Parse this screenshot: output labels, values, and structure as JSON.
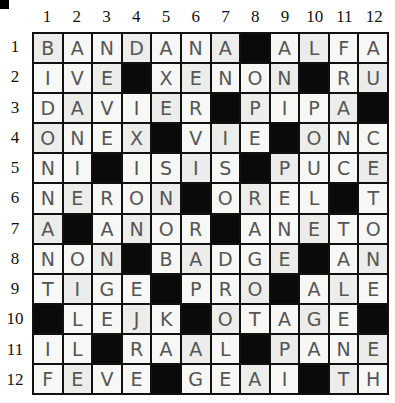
{
  "puzzle": {
    "type": "crossword",
    "rows": 12,
    "cols": 12,
    "column_numbers": [
      "1",
      "2",
      "3",
      "4",
      "5",
      "6",
      "7",
      "8",
      "9",
      "10",
      "11",
      "12"
    ],
    "row_numbers": [
      "1",
      "2",
      "3",
      "4",
      "5",
      "6",
      "7",
      "8",
      "9",
      "10",
      "11",
      "12"
    ],
    "grid": [
      [
        "B",
        "A",
        "N",
        "D",
        "A",
        "N",
        "A",
        "#",
        "A",
        "L",
        "F",
        "A"
      ],
      [
        "I",
        "V",
        "E",
        "#",
        "X",
        "E",
        "N",
        "O",
        "N",
        "#",
        "R",
        "U"
      ],
      [
        "D",
        "A",
        "V",
        "I",
        "E",
        "R",
        "#",
        "P",
        "I",
        "P",
        "A",
        "#"
      ],
      [
        "O",
        "N",
        "E",
        "X",
        "#",
        "V",
        "I",
        "E",
        "#",
        "O",
        "N",
        "C"
      ],
      [
        "N",
        "I",
        "#",
        "I",
        "S",
        "I",
        "S",
        "#",
        "P",
        "U",
        "C",
        "E"
      ],
      [
        "N",
        "E",
        "R",
        "O",
        "N",
        "#",
        "O",
        "R",
        "E",
        "L",
        "#",
        "T"
      ],
      [
        "A",
        "#",
        "A",
        "N",
        "O",
        "R",
        "#",
        "A",
        "N",
        "E",
        "T",
        "O"
      ],
      [
        "N",
        "O",
        "N",
        "#",
        "B",
        "A",
        "D",
        "G",
        "E",
        "#",
        "A",
        "N"
      ],
      [
        "T",
        "I",
        "G",
        "E",
        "#",
        "P",
        "R",
        "O",
        "#",
        "A",
        "L",
        "E"
      ],
      [
        "#",
        "L",
        "E",
        "J",
        "K",
        "#",
        "O",
        "T",
        "A",
        "G",
        "E",
        "#"
      ],
      [
        "I",
        "L",
        "#",
        "R",
        "A",
        "A",
        "L",
        "#",
        "P",
        "A",
        "N",
        "E"
      ],
      [
        "F",
        "E",
        "V",
        "E",
        "#",
        "G",
        "E",
        "A",
        "I",
        "#",
        "T",
        "H"
      ]
    ]
  },
  "colors": {
    "block": "#0a0a0a",
    "cell": "#f7f7f5",
    "ink": "#555555",
    "grid_line": "#111111"
  }
}
